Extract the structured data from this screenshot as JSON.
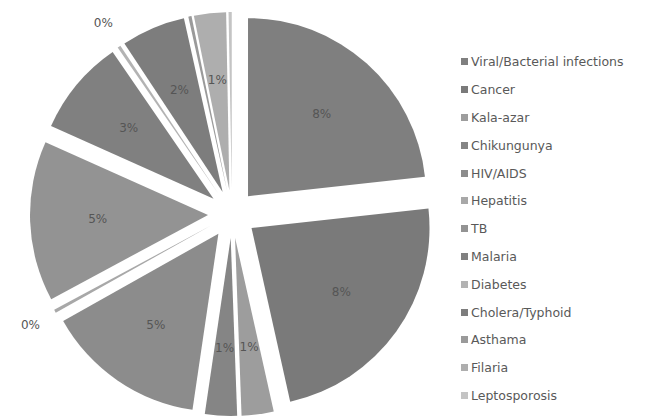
{
  "chart_data": {
    "type": "pie",
    "title": "",
    "exploded": true,
    "legend_position": "right",
    "categories": [
      "Viral/Bacterial infections",
      "Cancer",
      "Kala-azar",
      "Chikungunya",
      "HIV/AIDS",
      "Hepatitis",
      "TB",
      "Malaria",
      "Diabetes",
      "Cholera/Typhoid",
      "Asthama",
      "Filaria",
      "Leptosporosis"
    ],
    "labels": [
      "8%",
      "8%",
      "1%",
      "1%",
      "5%",
      "0%",
      "5%",
      "3%",
      "0%",
      "2%",
      "0%",
      "1%",
      "0%"
    ],
    "values": [
      8,
      8,
      1,
      1,
      5,
      0.1,
      5,
      3,
      0.1,
      2,
      0.1,
      1,
      0.1
    ],
    "colors": [
      "#7f7f7f",
      "#7a7a7a",
      "#9d9d9d",
      "#858585",
      "#8c8c8c",
      "#a8a8a8",
      "#939393",
      "#808080",
      "#b3b3b3",
      "#7d7d7d",
      "#9a9a9a",
      "#aeaeae",
      "#c4c4c4"
    ]
  },
  "legend": {
    "items": [
      {
        "label": "Viral/Bacterial infections",
        "color": "#7f7f7f"
      },
      {
        "label": "Cancer",
        "color": "#7a7a7a"
      },
      {
        "label": "Kala-azar",
        "color": "#9d9d9d"
      },
      {
        "label": "Chikungunya",
        "color": "#858585"
      },
      {
        "label": "HIV/AIDS",
        "color": "#8c8c8c"
      },
      {
        "label": "Hepatitis",
        "color": "#a8a8a8"
      },
      {
        "label": "TB",
        "color": "#939393"
      },
      {
        "label": "Malaria",
        "color": "#808080"
      },
      {
        "label": "Diabetes",
        "color": "#b3b3b3"
      },
      {
        "label": "Cholera/Typhoid",
        "color": "#7d7d7d"
      },
      {
        "label": "Asthama",
        "color": "#9a9a9a"
      },
      {
        "label": "Filaria",
        "color": "#aeaeae"
      },
      {
        "label": "Leptosporosis",
        "color": "#c4c4c4"
      }
    ]
  }
}
